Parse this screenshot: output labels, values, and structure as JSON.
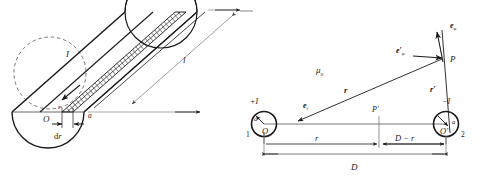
{
  "figure": {
    "panels": [
      {
        "id": "left",
        "name": "cylindrical-conductor",
        "description": "Long cylinder of radius a carrying current I, with annular element of radius r and thickness dr shown hatched, length l",
        "labels": {
          "current": "I",
          "length": "l",
          "origin": "O",
          "radius_element": "r",
          "thickness": "dr",
          "outer_radius": "a"
        }
      },
      {
        "id": "right",
        "name": "two-wire-line",
        "description": "Two parallel wires of radius a separated by D carrying currents +I and -I, field point P and P'",
        "labels": {
          "permeability": "μ",
          "permeability_sub": "0",
          "current_left": "+I",
          "current_right": "−I",
          "origin_left": "O",
          "origin_right": "O′",
          "wire_left_number": "1",
          "wire_right_number": "2",
          "radius_left": "a",
          "radius_right": "a",
          "unit_vector_r": "e",
          "unit_vector_r_sub": "r",
          "unit_vector_phi": "e",
          "unit_vector_phi_sub": "φ",
          "unit_vector_phi_prime": "e′",
          "unit_vector_phi_prime_sub": "φ",
          "vector_r": "r",
          "vector_r_prime": "r′",
          "field_point": "P",
          "field_point_prime": "P′",
          "dim_r": "r",
          "dim_d_minus_r": "D − r",
          "dim_D": "D"
        }
      }
    ],
    "colors": {
      "ink": "#1a1a1a",
      "thin_ink": "#6a6a6a",
      "background": "#ffffff"
    }
  }
}
